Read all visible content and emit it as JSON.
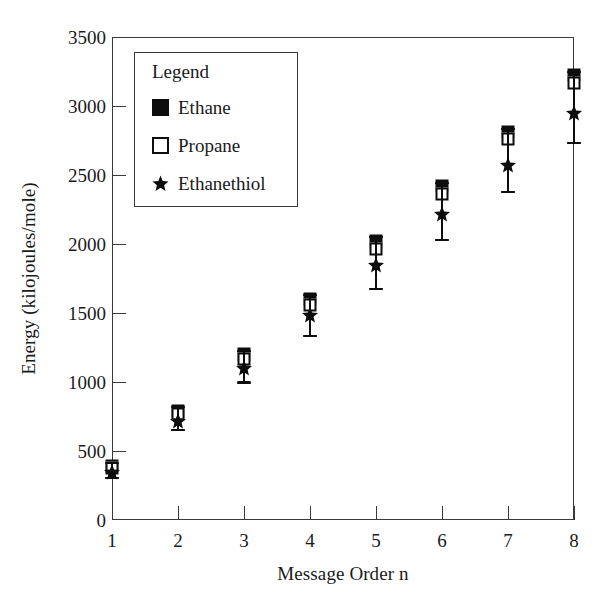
{
  "chart_data": {
    "type": "scatter",
    "title": "",
    "xlabel": "Message Order n",
    "ylabel": "Energy (kilojoules/mole)",
    "xlim": [
      1,
      8
    ],
    "ylim": [
      0,
      3500
    ],
    "xticks": [
      1,
      2,
      3,
      4,
      5,
      6,
      7,
      8
    ],
    "xtick_labels": [
      "1",
      "2",
      "3",
      "4",
      "5",
      "6",
      "7",
      "8"
    ],
    "yticks": [
      0,
      500,
      1000,
      1500,
      2000,
      2500,
      3000,
      3500
    ],
    "ytick_labels": [
      "0",
      "500",
      "1000",
      "1500",
      "2000",
      "2500",
      "3000",
      "3500"
    ],
    "grid": false,
    "legend_position": "upper left",
    "legend_title": "Legend",
    "x": [
      1,
      2,
      3,
      4,
      5,
      6,
      7,
      8
    ],
    "series": [
      {
        "name": "Ethane",
        "marker": "filled-square",
        "color": "#0d0d0d",
        "values": [
          390,
          790,
          1200,
          1600,
          2020,
          2420,
          2810,
          3225
        ],
        "err_low": [
          85,
          140,
          205,
          265,
          345,
          390,
          430,
          490
        ],
        "err_high": [
          25,
          30,
          25,
          30,
          30,
          25,
          25,
          25
        ]
      },
      {
        "name": "Propane",
        "marker": "open-square",
        "color": "#0d0d0d",
        "values": [
          375,
          765,
          1165,
          1555,
          1965,
          2365,
          2760,
          3165
        ],
        "err_low": [
          70,
          115,
          170,
          220,
          290,
          335,
          380,
          430
        ],
        "err_high": [
          40,
          55,
          60,
          75,
          85,
          80,
          75,
          85
        ]
      },
      {
        "name": "Ethanethiol",
        "marker": "star",
        "color": "#0d0d0d",
        "values": [
          345,
          720,
          1105,
          1485,
          1850,
          2215,
          2570,
          2950
        ],
        "err_low": [
          40,
          70,
          105,
          150,
          175,
          185,
          190,
          215
        ],
        "err_high": [
          70,
          100,
          120,
          145,
          200,
          230,
          265,
          300
        ]
      }
    ]
  },
  "legend": {
    "title": "Legend",
    "entries": [
      {
        "label": "Ethane",
        "marker": "filled-square"
      },
      {
        "label": "Propane",
        "marker": "open-square"
      },
      {
        "label": "Ethanethiol",
        "marker": "star"
      }
    ]
  },
  "axes": {
    "y_title": "Energy (kilojoules/mole)",
    "x_title": "Message Order n"
  }
}
